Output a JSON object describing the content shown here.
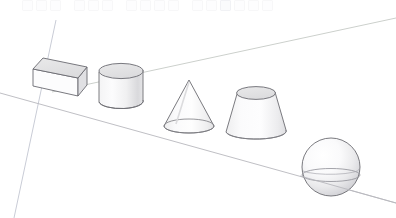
{
  "app": {
    "title": "3D Modeling Viewport",
    "background_color": "#ffffff"
  },
  "toolbar": {
    "visible": true,
    "buttons": [
      {
        "label": "",
        "name": "tool-select",
        "active": false
      },
      {
        "label": "",
        "name": "tool-eraser",
        "active": false
      },
      {
        "label": "",
        "name": "tool-line",
        "active": false
      },
      {
        "label": "",
        "name": "tool-arc",
        "active": false
      },
      {
        "label": "",
        "name": "tool-rectangle",
        "active": false
      },
      {
        "label": "",
        "name": "tool-circle",
        "active": false
      },
      {
        "label": "",
        "name": "tool-pushpull",
        "active": false
      },
      {
        "label": "",
        "name": "tool-move",
        "active": false
      },
      {
        "label": "",
        "name": "tool-rotate",
        "active": false
      },
      {
        "label": "",
        "name": "tool-scale",
        "active": false
      },
      {
        "label": "",
        "name": "tool-tape",
        "active": false
      },
      {
        "label": "",
        "name": "tool-paint",
        "active": false
      },
      {
        "label": "",
        "name": "tool-orbit",
        "active": true
      },
      {
        "label": "",
        "name": "tool-pan",
        "active": false
      },
      {
        "label": "",
        "name": "tool-zoom",
        "active": false
      },
      {
        "label": "",
        "name": "tool-zoom-extents",
        "active": false
      }
    ]
  },
  "scene": {
    "name": "primitive-solids-scene",
    "style": "hidden-line-shaded",
    "colors": {
      "edge": "#5a5a5f",
      "edge_soft": "#9a9aa0",
      "fill_light": "#fbfbfc",
      "fill_mid": "#ececed",
      "fill_shade": "#dcdcde",
      "fill_top": "#e3e3e5",
      "axis_blue": "#c9ccd6",
      "axis_green": "#cdd3cd",
      "ground_line": "#b6b6bb"
    },
    "axes": [
      {
        "name": "axis-blue-vertical",
        "label": "blue-axis",
        "x1": 56,
        "y1": 20,
        "x2": 14,
        "y2": 218
      },
      {
        "name": "axis-green-right",
        "label": "green-axis",
        "x1": 52,
        "y1": 92,
        "x2": 396,
        "y2": 18
      },
      {
        "name": "ground-line",
        "label": "red-axis-ground",
        "x1": 0,
        "y1": 93,
        "x2": 396,
        "y2": 203
      }
    ],
    "solids": [
      {
        "name": "box",
        "label": "Box",
        "type": "cuboid",
        "center_x": 57,
        "center_y": 73,
        "width": 52,
        "height": 36
      },
      {
        "name": "cylinder",
        "label": "Cylinder",
        "type": "cylinder",
        "center_x": 121,
        "center_y": 85,
        "radius": 22,
        "height": 34
      },
      {
        "name": "cone",
        "label": "Cone",
        "type": "cone",
        "center_x": 189,
        "center_y": 105,
        "radius": 25,
        "height": 47
      },
      {
        "name": "frustum",
        "label": "Truncated Cone",
        "type": "frustum",
        "center_x": 256,
        "center_y": 113,
        "top_radius": 19,
        "bottom_radius": 30,
        "height": 42
      },
      {
        "name": "sphere",
        "label": "Sphere",
        "type": "sphere",
        "center_x": 331,
        "center_y": 167,
        "radius": 29
      }
    ]
  }
}
